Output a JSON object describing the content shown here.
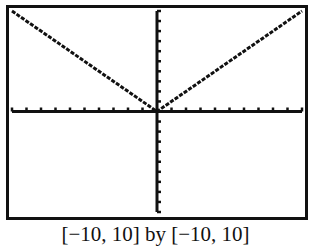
{
  "caption": "[−10, 10] by [−10, 10]",
  "chart_data": {
    "type": "line",
    "title": "",
    "xlabel": "",
    "ylabel": "",
    "xlim": [
      -10,
      10
    ],
    "ylim": [
      -10,
      10
    ],
    "xscale_ticks": 1,
    "yscale_ticks": 1,
    "grid": false,
    "series": [
      {
        "name": "y = |x|",
        "x": [
          -10,
          0,
          10
        ],
        "y": [
          10,
          0,
          10
        ]
      }
    ],
    "caption": "[−10, 10] by [−10, 10]"
  }
}
